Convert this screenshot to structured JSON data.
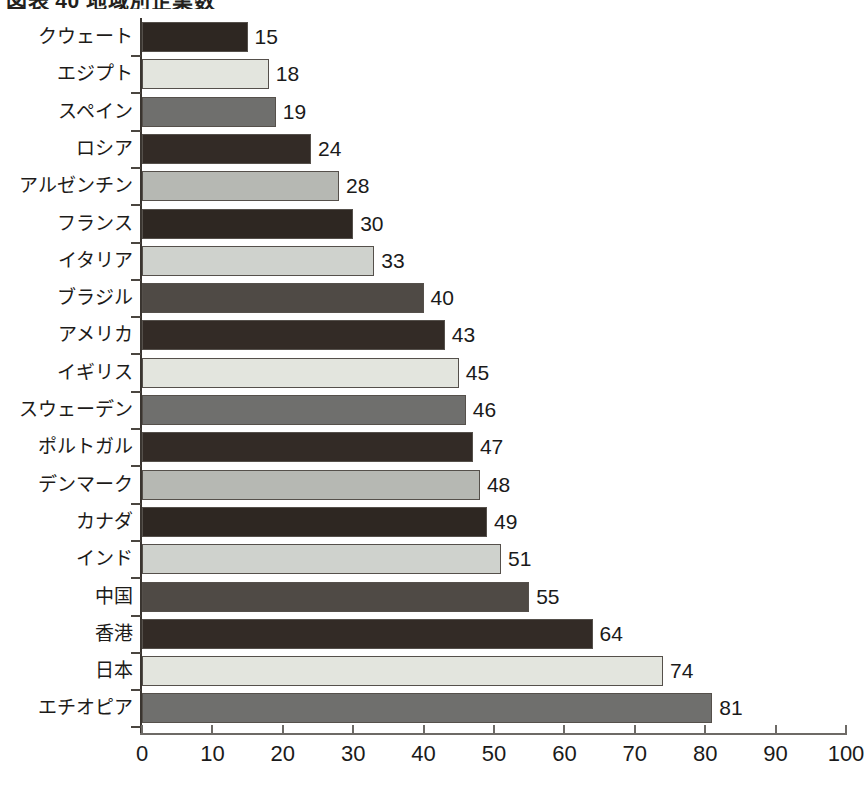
{
  "chart_data": {
    "type": "bar",
    "orientation": "horizontal",
    "title": "図表 40 地域別企業数",
    "xlabel": "",
    "ylabel": "",
    "xlim": [
      0,
      100
    ],
    "xticks": [
      0,
      10,
      20,
      30,
      40,
      50,
      60,
      70,
      80,
      90,
      100
    ],
    "grid": false,
    "legend": "none",
    "categories": [
      "クウェート",
      "エジプト",
      "スペイン",
      "ロシア",
      "アルゼンチン",
      "フランス",
      "イタリア",
      "ブラジル",
      "アメリカ",
      "イギリス",
      "スウェーデン",
      "ポルトガル",
      "デンマーク",
      "カナダ",
      "インド",
      "中国",
      "香港",
      "日本",
      "エチオピア"
    ],
    "values": [
      15,
      18,
      19,
      24,
      28,
      30,
      33,
      40,
      43,
      45,
      46,
      47,
      48,
      49,
      51,
      55,
      64,
      74,
      81
    ],
    "bar_colors": [
      "#2e2722",
      "#e3e5de",
      "#6f6f6d",
      "#332b26",
      "#b6b8b3",
      "#2e2722",
      "#cfd2cd",
      "#4f4a45",
      "#332b26",
      "#e3e5de",
      "#6f6f6d",
      "#332b26",
      "#b6b8b3",
      "#2e2722",
      "#cfd2cd",
      "#4f4a45",
      "#332b26",
      "#e3e5de",
      "#6f6f6d"
    ],
    "palette": {
      "dark": "#2e2722",
      "cream": "#e3e5de",
      "gray_medium": "#6f6f6d",
      "dark_brown": "#332b26",
      "gray_light": "#b6b8b3",
      "gray_pale": "#cfd2cd",
      "gray_dark": "#4f4a45",
      "axis": "#3a3530",
      "text": "#1a1a1a",
      "background": "#ffffff"
    }
  }
}
